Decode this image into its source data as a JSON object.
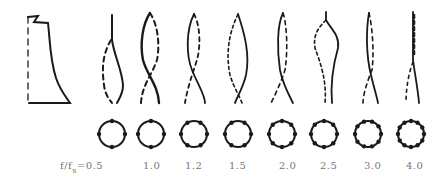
{
  "figure": {
    "axis_label_prefix": "f/f",
    "axis_label_subscript": "s",
    "axis_label_equals": "=",
    "ratios": [
      "0.5",
      "1.0",
      "1.2",
      "1.5",
      "2.0",
      "2.5",
      "3.0",
      "4.0"
    ],
    "circumferential_nodes": [
      4,
      4,
      6,
      6,
      8,
      8,
      10,
      12
    ],
    "stroke_color": "#1a1a1a",
    "label_color": "#777777"
  }
}
